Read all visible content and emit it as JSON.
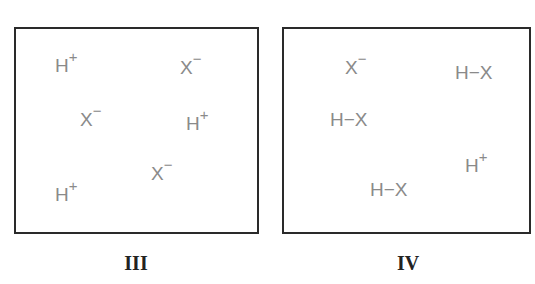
{
  "panels": [
    {
      "label": "III",
      "species": [
        {
          "base": "H",
          "charge": "+",
          "x": 55,
          "y": 56
        },
        {
          "base": "X",
          "charge": "−",
          "x": 180,
          "y": 58
        },
        {
          "base": "X",
          "charge": "−",
          "x": 80,
          "y": 110
        },
        {
          "base": "H",
          "charge": "+",
          "x": 186,
          "y": 114
        },
        {
          "base": "X",
          "charge": "−",
          "x": 151,
          "y": 164
        },
        {
          "base": "H",
          "charge": "+",
          "x": 55,
          "y": 185
        }
      ]
    },
    {
      "label": "IV",
      "species": [
        {
          "base": "X",
          "charge": "−",
          "x": 345,
          "y": 58
        },
        {
          "base": "H−X",
          "charge": "",
          "x": 455,
          "y": 63
        },
        {
          "base": "H−X",
          "charge": "",
          "x": 330,
          "y": 110
        },
        {
          "base": "H",
          "charge": "+",
          "x": 465,
          "y": 156
        },
        {
          "base": "H−X",
          "charge": "",
          "x": 370,
          "y": 180
        }
      ]
    }
  ]
}
